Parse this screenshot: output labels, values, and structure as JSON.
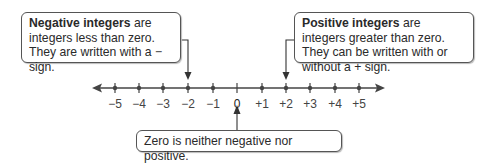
{
  "callouts": {
    "negative": {
      "bold": "Negative integers",
      "text": " are integers less than zero. They are written with a − sign."
    },
    "positive": {
      "bold": "Positive integers",
      "text": " are integers greater than zero. They can be written with or without a + sign."
    },
    "zero": {
      "text": "Zero is neither negative nor positive."
    }
  },
  "number_line": {
    "labels": [
      "−5",
      "−4",
      "−3",
      "−2",
      "−1",
      "0",
      "+1",
      "+2",
      "+3",
      "+4",
      "+5"
    ]
  }
}
